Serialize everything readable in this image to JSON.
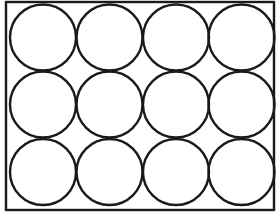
{
  "diagram": {
    "rows": 3,
    "columns": 4,
    "stroke_color": "#1a1a1a",
    "background_color": "#ffffff",
    "rectangle": {
      "x": 6,
      "y": 2,
      "width": 268,
      "height": 208
    },
    "circle_radius": 33,
    "column_centers": [
      43,
      109.5,
      176,
      241.5
    ],
    "row_centers": [
      37.5,
      104.5,
      172
    ]
  }
}
